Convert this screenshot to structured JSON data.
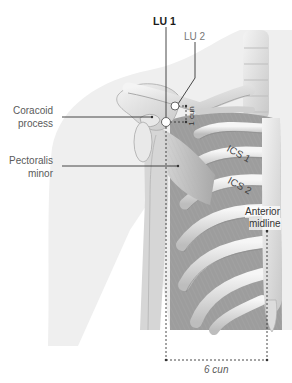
{
  "diagram": {
    "type": "anatomical-acupuncture-point-diagram",
    "points": [
      {
        "id": "LU1",
        "label": "LU 1",
        "x": 166,
        "y": 122
      },
      {
        "id": "LU2",
        "label": "LU 2",
        "x": 175,
        "y": 106
      }
    ],
    "labels": {
      "lu1": "LU 1",
      "lu2": "LU 2",
      "coracoid_line1": "Coracoid",
      "coracoid_line2": "process",
      "pectoralis_line1": "Pectoralis",
      "pectoralis_line2": "minor",
      "ics1": "ICS 1",
      "ics2": "ICS 2",
      "anterior_line1": "Anterior",
      "anterior_line2": "midline",
      "one_cun": "1 cun",
      "six_cun": "6 cun"
    },
    "measurements": [
      {
        "label": "1 cun",
        "from": "LU2",
        "to": "LU1",
        "orientation": "vertical"
      },
      {
        "label": "6 cun",
        "from": "LU1 vertical line",
        "to": "Anterior midline",
        "orientation": "horizontal"
      }
    ],
    "colors": {
      "silhouette": "#eeeeee",
      "bone": "#e4e4e4",
      "bone_shadow": "#b8b8b8",
      "muscle": "#c9c9c9",
      "line": "#333333",
      "point_fill": "#ffffff"
    }
  }
}
